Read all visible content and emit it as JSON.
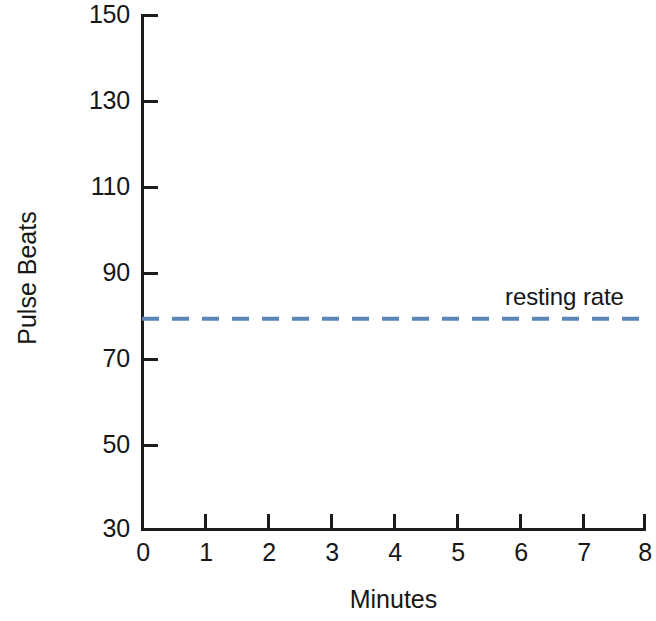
{
  "chart_data": {
    "type": "line",
    "title": "",
    "subtitle": "",
    "xlabel": "Minutes",
    "ylabel": "Pulse  Beats",
    "xlim": [
      0,
      8
    ],
    "ylim": [
      30,
      150
    ],
    "grid": false,
    "legend_position": "none",
    "x_ticks": [
      "0",
      "1",
      "2",
      "3",
      "4",
      "5",
      "6",
      "7",
      "8"
    ],
    "x_tick_values": [
      0,
      1,
      2,
      3,
      4,
      5,
      6,
      7,
      8
    ],
    "y_ticks": [
      "150",
      "130",
      "110",
      "90",
      "70",
      "50",
      "30"
    ],
    "y_tick_values": [
      150,
      130,
      110,
      90,
      70,
      50,
      30
    ],
    "series": [
      {
        "name": "resting rate",
        "style": "dashed",
        "color": "#5b87b8",
        "x": [
          0,
          8
        ],
        "values": [
          79,
          79
        ]
      }
    ],
    "annotations": [
      {
        "text": "resting rate",
        "x": 6.45,
        "y": 86,
        "color": "#161616"
      }
    ]
  },
  "axes": {
    "line_color": "#1c1c1c",
    "background": "#ffffff"
  }
}
